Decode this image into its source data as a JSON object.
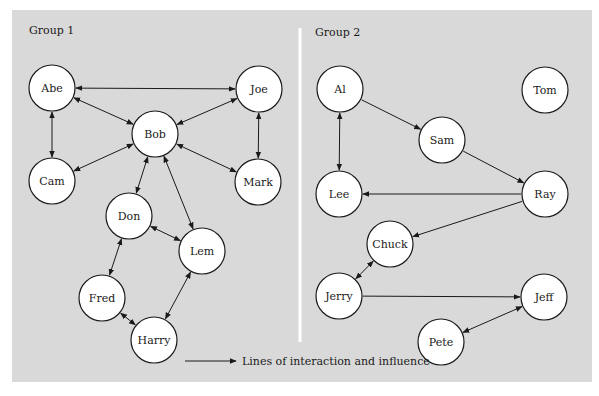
{
  "groups": [
    {
      "label": "Group 1"
    },
    {
      "label": "Group 2"
    }
  ],
  "legend": {
    "label": "Lines of interaction and influence"
  },
  "nodes": [
    {
      "id": "abe",
      "label": "Abe",
      "x": 52,
      "y": 88
    },
    {
      "id": "joe",
      "label": "Joe",
      "x": 259,
      "y": 89
    },
    {
      "id": "bob",
      "label": "Bob",
      "x": 155,
      "y": 134
    },
    {
      "id": "cam",
      "label": "Cam",
      "x": 52,
      "y": 181
    },
    {
      "id": "mark",
      "label": "Mark",
      "x": 258,
      "y": 182
    },
    {
      "id": "don",
      "label": "Don",
      "x": 129,
      "y": 216
    },
    {
      "id": "lem",
      "label": "Lem",
      "x": 202,
      "y": 251
    },
    {
      "id": "fred",
      "label": "Fred",
      "x": 102,
      "y": 298
    },
    {
      "id": "harry",
      "label": "Harry",
      "x": 154,
      "y": 340
    },
    {
      "id": "al",
      "label": "Al",
      "x": 340,
      "y": 89
    },
    {
      "id": "tom",
      "label": "Tom",
      "x": 545,
      "y": 90
    },
    {
      "id": "sam",
      "label": "Sam",
      "x": 442,
      "y": 140
    },
    {
      "id": "lee",
      "label": "Lee",
      "x": 339,
      "y": 194
    },
    {
      "id": "ray",
      "label": "Ray",
      "x": 545,
      "y": 194
    },
    {
      "id": "chuck",
      "label": "Chuck",
      "x": 390,
      "y": 244
    },
    {
      "id": "jerry",
      "label": "Jerry",
      "x": 339,
      "y": 296
    },
    {
      "id": "jeff",
      "label": "Jeff",
      "x": 544,
      "y": 297
    },
    {
      "id": "pete",
      "label": "Pete",
      "x": 441,
      "y": 342
    }
  ],
  "edges": [
    {
      "from": "abe",
      "to": "joe",
      "type": "both"
    },
    {
      "from": "abe",
      "to": "bob",
      "type": "both"
    },
    {
      "from": "abe",
      "to": "cam",
      "type": "both"
    },
    {
      "from": "joe",
      "to": "bob",
      "type": "both"
    },
    {
      "from": "joe",
      "to": "mark",
      "type": "both"
    },
    {
      "from": "cam",
      "to": "bob",
      "type": "both"
    },
    {
      "from": "bob",
      "to": "mark",
      "type": "both"
    },
    {
      "from": "bob",
      "to": "don",
      "type": "both"
    },
    {
      "from": "bob",
      "to": "lem",
      "type": "both"
    },
    {
      "from": "don",
      "to": "lem",
      "type": "both"
    },
    {
      "from": "don",
      "to": "fred",
      "type": "both"
    },
    {
      "from": "fred",
      "to": "harry",
      "type": "both"
    },
    {
      "from": "lem",
      "to": "harry",
      "type": "both"
    },
    {
      "from": "al",
      "to": "lee",
      "type": "both"
    },
    {
      "from": "al",
      "to": "sam",
      "type": "forward"
    },
    {
      "from": "sam",
      "to": "ray",
      "type": "forward"
    },
    {
      "from": "ray",
      "to": "lee",
      "type": "forward"
    },
    {
      "from": "ray",
      "to": "chuck",
      "type": "forward"
    },
    {
      "from": "chuck",
      "to": "jerry",
      "type": "both"
    },
    {
      "from": "jerry",
      "to": "jeff",
      "type": "forward"
    },
    {
      "from": "jeff",
      "to": "pete",
      "type": "both"
    }
  ],
  "colors": {
    "panel_bg": "#d9d9d9",
    "node_fill": "#ffffff",
    "stroke": "#1a1a1a",
    "divider": "#ffffff"
  }
}
